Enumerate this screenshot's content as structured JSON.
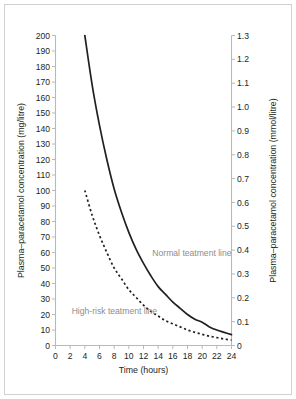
{
  "figure": {
    "background_color": "#ffffff",
    "border_color": "#d0d0d0",
    "axis_color": "#b9b9b9",
    "curve_color": "#231f20",
    "annotation_color": "#8d8d8d"
  },
  "chart_data": {
    "type": "line",
    "title": "",
    "xlabel": "Time (hours)",
    "ylabel": "Plasma–paracetamol concentration (mg/litre)",
    "ylabel_right": "Plasma–paracetamol concentration (mmol/litre)",
    "xlim": [
      0,
      24
    ],
    "ylim": [
      0,
      200
    ],
    "ylim_right": [
      0,
      1.3
    ],
    "grid": false,
    "legend_position": "inline-annotations",
    "xticks": [
      0,
      2,
      4,
      6,
      8,
      10,
      12,
      14,
      16,
      18,
      20,
      22,
      24
    ],
    "xtick_labels": [
      "0",
      "2",
      "4",
      "6",
      "8",
      "10",
      "12",
      "14",
      "16",
      "18",
      "20",
      "22",
      "24"
    ],
    "yticks": [
      0,
      10,
      20,
      30,
      40,
      50,
      60,
      70,
      80,
      90,
      100,
      110,
      120,
      130,
      140,
      150,
      160,
      170,
      180,
      190,
      200
    ],
    "ytick_labels": [
      "0",
      "10",
      "20",
      "30",
      "40",
      "50",
      "60",
      "70",
      "80",
      "90",
      "100",
      "110",
      "120",
      "130",
      "140",
      "150",
      "160",
      "170",
      "180",
      "190",
      "200"
    ],
    "yticks_right": [
      0,
      0.1,
      0.2,
      0.3,
      0.4,
      0.5,
      0.6,
      0.7,
      0.8,
      0.9,
      1.0,
      1.1,
      1.2,
      1.3
    ],
    "ytick_labels_right": [
      "0",
      "0.1",
      "0.2",
      "0.3",
      "0.4",
      "0.5",
      "0.6",
      "0.7",
      "0.8",
      "0.9",
      "1.0",
      "1.1",
      "1.2",
      "1.3"
    ],
    "series": [
      {
        "name": "Normal teatment line",
        "style": "solid",
        "x": [
          4,
          5,
          6,
          7,
          8,
          9,
          10,
          11,
          12,
          13,
          14,
          15,
          16,
          17,
          18,
          19,
          20,
          21,
          22,
          23,
          24
        ],
        "values": [
          200,
          168,
          142,
          120,
          101,
          86,
          73,
          62,
          53,
          45,
          38,
          33,
          28,
          24,
          20,
          17,
          15,
          12,
          10,
          8.5,
          7
        ]
      },
      {
        "name": "High-risk teatment line",
        "style": "dotted",
        "x": [
          4,
          5,
          6,
          7,
          8,
          9,
          10,
          11,
          12,
          13,
          14,
          15,
          16,
          17,
          18,
          19,
          20,
          21,
          22,
          23,
          24
        ],
        "values": [
          100,
          84,
          71,
          60,
          50,
          43,
          36,
          31,
          26,
          22,
          19,
          16,
          14,
          12,
          10,
          8.5,
          7.2,
          6,
          5.1,
          4.2,
          3.5
        ]
      }
    ],
    "annotations": [
      {
        "text": "Normal teatment line",
        "x": 13.2,
        "y": 60
      },
      {
        "text": "High-risk teatment line",
        "x": 2.2,
        "y": 22
      }
    ]
  }
}
